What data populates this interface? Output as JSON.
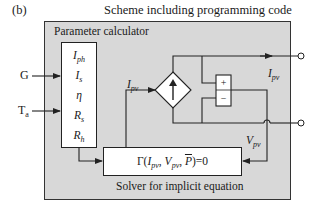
{
  "figure": {
    "tag": "(b)",
    "title": "Scheme including programming code"
  },
  "blocks": {
    "parameter_calculator": {
      "label": "Parameter calculator",
      "parameters": [
        {
          "symbol": "I",
          "sub": "ph"
        },
        {
          "symbol": "I",
          "sub": "s"
        },
        {
          "symbol": "η",
          "sub": ""
        },
        {
          "symbol": "R",
          "sub": "s"
        },
        {
          "symbol": "R",
          "sub": "h"
        }
      ]
    },
    "solver": {
      "label": "Solver for implicit equation",
      "equation": {
        "prefix": "Γ(",
        "var1": "I",
        "var1_sub": "pv",
        "sep1": ", ",
        "var2": "V",
        "var2_sub": "pv",
        "sep2": ", ",
        "var3": "P",
        "suffix": ")=0"
      }
    },
    "controlled_source": {
      "type": "current-source",
      "symbol": "↑"
    },
    "voltage_measure": {
      "plus": "+",
      "minus": "−"
    }
  },
  "inputs": {
    "irradiance": "G",
    "temperature": {
      "symbol": "T",
      "sub": "a"
    }
  },
  "signals": {
    "ipv_to_source": {
      "symbol": "I",
      "sub": "pv"
    },
    "ipv_output": {
      "symbol": "I",
      "sub": "pv"
    },
    "vpv_feedback": {
      "symbol": "V",
      "sub": "pv"
    }
  },
  "colors": {
    "panel_bg": "#d8d8d8",
    "block_bg": "#ffffff",
    "line": "#222222"
  }
}
